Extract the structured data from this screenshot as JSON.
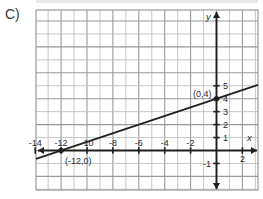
{
  "problem": {
    "choice_label": "C)"
  },
  "chart_data": {
    "type": "line",
    "title": "",
    "subtitle": "",
    "xlabel": "x",
    "ylabel": "y",
    "xlim": [
      -14.8,
      3.2
    ],
    "ylim": [
      -3.1,
      5.9
    ],
    "grid": true,
    "grid_step": 1,
    "legend": null,
    "x_tick_labels": [
      "-14",
      "-12",
      "-10",
      "-8",
      "-6",
      "-4",
      "-2",
      "2"
    ],
    "x_tick_values": [
      -14,
      -12,
      -10,
      -8,
      -6,
      -4,
      -2,
      2
    ],
    "y_tick_labels": [
      "5",
      "4",
      "3",
      "2",
      "1",
      "-1"
    ],
    "y_tick_values": [
      5,
      4,
      3,
      2,
      1,
      -1
    ],
    "series": [
      {
        "name": "line",
        "slope": 0.3333333,
        "intercept": 4,
        "equation": "y = (1/3)x + 4",
        "x": [
          -14.8,
          3.2
        ],
        "y": [
          -0.933,
          5.067
        ]
      }
    ],
    "points": [
      {
        "label": "(0,4)",
        "x": 0,
        "y": 4
      },
      {
        "label": "(-12,0)",
        "x": -12,
        "y": 0
      }
    ],
    "axis_arrows": [
      "left",
      "right",
      "up",
      "down"
    ]
  },
  "colors": {
    "grid_line": "#b9b9b9",
    "grid_major": "#9a9a9a",
    "axis": "#1f1f1f",
    "plot_line": "#1f1f1f",
    "text": "#2b2b2b",
    "background": "#ffffff",
    "top_band": "#e8e8e8"
  }
}
